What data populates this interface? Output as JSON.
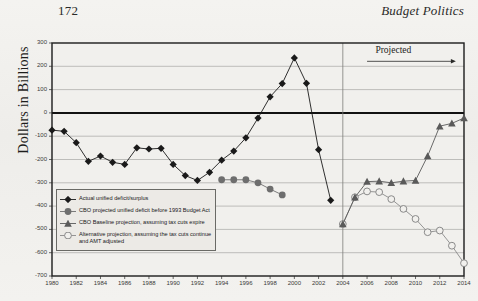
{
  "page": {
    "number": "172",
    "running_head": "Budget Politics"
  },
  "chart_data": {
    "type": "line",
    "title": "",
    "xlabel": "",
    "ylabel": "Dollars in Billions",
    "xlim": [
      1980,
      2014
    ],
    "ylim": [
      -700,
      300
    ],
    "ytick_step": 100,
    "xtick_step": 2,
    "grid": true,
    "zero_line": true,
    "legend_position": "lower-left",
    "annotations": [
      {
        "text": "Projected",
        "x": 2009,
        "y": 260,
        "arrow": true,
        "arrow_from": 2006,
        "arrow_to": 2013
      }
    ],
    "divider_x": 2004,
    "yticks": [
      300,
      200,
      100,
      0,
      -100,
      -200,
      -300,
      -400,
      -500,
      -600,
      -700
    ],
    "xticks": [
      1980,
      1982,
      1984,
      1986,
      1988,
      1990,
      1992,
      1994,
      1996,
      1998,
      2000,
      2002,
      2004,
      2006,
      2008,
      2010,
      2012,
      2014
    ],
    "series": [
      {
        "name": "Actual unified deficit/surplus",
        "marker": "diamond",
        "color": "#1a1a1a",
        "x": [
          1980,
          1981,
          1982,
          1983,
          1984,
          1985,
          1986,
          1987,
          1988,
          1989,
          1990,
          1991,
          1992,
          1993,
          1994,
          1995,
          1996,
          1997,
          1998,
          1999,
          2000,
          2001,
          2002,
          2003
        ],
        "values": [
          -74,
          -79,
          -128,
          -208,
          -185,
          -212,
          -221,
          -150,
          -155,
          -152,
          -221,
          -269,
          -290,
          -255,
          -203,
          -164,
          -107,
          -22,
          69,
          126,
          236,
          127,
          -158,
          -375
        ]
      },
      {
        "name": "CBO projected unified deficit before 1993 Budget Act",
        "marker": "circle-filled",
        "color": "#6e6e6e",
        "x": [
          1994,
          1995,
          1996,
          1997,
          1998,
          1999
        ],
        "values": [
          -287,
          -287,
          -287,
          -300,
          -327,
          -352
        ]
      },
      {
        "name": "CBO Baseline projection, assuming tax cuts expire",
        "marker": "triangle",
        "color": "#5a5a5a",
        "x": [
          2004,
          2005,
          2006,
          2007,
          2008,
          2009,
          2010,
          2011,
          2012,
          2013,
          2014
        ],
        "values": [
          -477,
          -362,
          -295,
          -293,
          -300,
          -293,
          -290,
          -185,
          -57,
          -45,
          -22
        ]
      },
      {
        "name": "Alternative projection, assuming the tax cuts continue\nand AMT adjusted",
        "marker": "circle-open",
        "color": "#8a8a8a",
        "x": [
          2004,
          2005,
          2006,
          2007,
          2008,
          2009,
          2010,
          2011,
          2012,
          2013,
          2014
        ],
        "values": [
          -477,
          -362,
          -337,
          -340,
          -370,
          -412,
          -455,
          -512,
          -505,
          -570,
          -645
        ]
      }
    ]
  }
}
